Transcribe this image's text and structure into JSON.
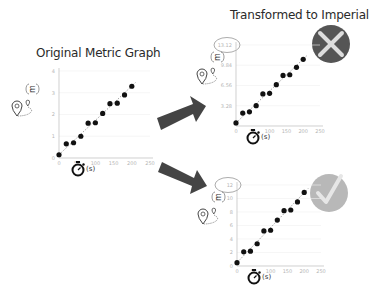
{
  "titles": {
    "original": "Original Metric Graph",
    "transformed": "Transformed to Imperial"
  },
  "axis_units": {
    "x_unit": "(s)",
    "y_unit_icon": "meters-icon"
  },
  "chart_data": [
    {
      "type": "scatter",
      "title": "Original Metric Graph",
      "xlabel": "(s)",
      "ylabel": "distance (m)",
      "x_ticks": [
        "0",
        "50",
        "100",
        "150",
        "200",
        "250"
      ],
      "y_ticks": [
        "0",
        "1",
        "2",
        "3",
        "4"
      ],
      "xlim": [
        0,
        250
      ],
      "ylim": [
        0,
        4
      ],
      "grid": true,
      "trend_line": "dashed",
      "x": [
        0,
        20,
        40,
        60,
        80,
        100,
        120,
        140,
        160,
        180,
        200
      ],
      "y": [
        0.15,
        0.65,
        0.7,
        1.0,
        1.6,
        1.62,
        2.05,
        2.5,
        2.52,
        2.9,
        3.3
      ]
    },
    {
      "type": "scatter",
      "title": "Transformed to Imperial",
      "status": "incorrect",
      "xlabel": "(s)",
      "ylabel": "distance (ft)",
      "x_ticks": [
        "0",
        "50",
        "100",
        "150",
        "200",
        "250"
      ],
      "y_ticks": [
        "3.28",
        "6.56",
        "9.84",
        "13.12"
      ],
      "highlighted_tick": "13.12",
      "xlim": [
        0,
        250
      ],
      "ylim": [
        0,
        13.12
      ],
      "grid": true,
      "trend_line": "dashed",
      "x": [
        0,
        20,
        40,
        60,
        80,
        100,
        120,
        140,
        160,
        180,
        200
      ],
      "y": [
        0.5,
        2.1,
        2.3,
        3.3,
        5.2,
        5.3,
        6.7,
        8.2,
        8.3,
        9.5,
        10.8
      ]
    },
    {
      "type": "scatter",
      "title": "Transformed to Imperial",
      "status": "correct",
      "xlabel": "(s)",
      "ylabel": "distance (ft)",
      "x_ticks": [
        "0",
        "50",
        "100",
        "150",
        "200",
        "250"
      ],
      "y_ticks": [
        "0",
        "2",
        "4",
        "6",
        "8",
        "10",
        "12"
      ],
      "highlighted_tick": "12",
      "xlim": [
        0,
        250
      ],
      "ylim": [
        0,
        12
      ],
      "grid": true,
      "trend_line": "dashed",
      "x": [
        0,
        20,
        40,
        60,
        80,
        100,
        120,
        140,
        160,
        180,
        200
      ],
      "y": [
        0.5,
        2.1,
        2.2,
        3.3,
        5.2,
        5.3,
        6.8,
        8.2,
        8.3,
        9.5,
        10.9
      ]
    }
  ],
  "badges": {
    "incorrect": {
      "icon": "x-icon",
      "color": "#555555"
    },
    "correct": {
      "icon": "check-icon",
      "color": "#b8b8b8"
    }
  },
  "arrows": {
    "color": "#444444"
  }
}
